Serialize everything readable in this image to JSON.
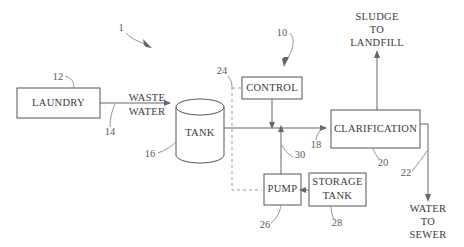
{
  "figure": {
    "system_ref": "1",
    "control_ref": "10"
  },
  "blocks": {
    "laundry": {
      "label": "LAUNDRY",
      "ref": "12"
    },
    "tank": {
      "label": "TANK",
      "ref": "16"
    },
    "control": {
      "label": "CONTROL",
      "ref": "10"
    },
    "clarification": {
      "label": "CLARIFICATION",
      "ref": "20"
    },
    "pump": {
      "label": "PUMP",
      "ref": "26"
    },
    "storage_tank": {
      "label_line1": "STORAGE",
      "label_line2": "TANK",
      "ref": "28"
    }
  },
  "flows": {
    "waste_water": {
      "line1": "WASTE",
      "line2": "WATER",
      "ref": "14"
    },
    "tank_to_clarification": {
      "ref": "18"
    },
    "pump_to_line": {
      "ref": "30"
    },
    "clarification_out": {
      "ref": "22"
    },
    "sludge": {
      "line1": "SLUDGE",
      "line2": "TO",
      "line3": "LANDFILL"
    },
    "sewer": {
      "line1": "WATER",
      "line2": "TO",
      "line3": "SEWER"
    }
  },
  "refs": {
    "r1": "1",
    "r10": "10",
    "r12": "12",
    "r14": "14",
    "r16": "16",
    "r18": "18",
    "r20": "20",
    "r22": "22",
    "r24": "24",
    "r26": "26",
    "r28": "28",
    "r30": "30"
  },
  "colors": {
    "stroke": "#555555",
    "connector": "#666666",
    "dashed": "#999999",
    "text": "#3a3a3a",
    "background": "#ffffff"
  }
}
